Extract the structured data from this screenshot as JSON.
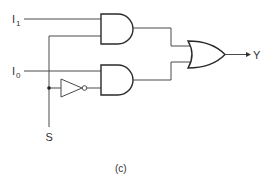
{
  "diagram": {
    "type": "2-to-1 multiplexer logic circuit",
    "caption": "(c)",
    "inputs": {
      "i1": {
        "main": "I",
        "sub": "1"
      },
      "i0": {
        "main": "I",
        "sub": "0"
      },
      "select": "S"
    },
    "output": "Y",
    "gates": [
      {
        "id": "and-gate-1",
        "type": "AND",
        "inputs": [
          "I1",
          "S"
        ]
      },
      {
        "id": "and-gate-0",
        "type": "AND",
        "inputs": [
          "I0",
          "NOT S"
        ]
      },
      {
        "id": "not-gate",
        "type": "NOT",
        "inputs": [
          "S"
        ]
      },
      {
        "id": "or-gate",
        "type": "OR",
        "inputs": [
          "AND1",
          "AND0"
        ],
        "output": "Y"
      }
    ],
    "colors": {
      "line": "#4a4a4a",
      "gate": "#2a2a2a",
      "text": "#333333",
      "background": "#ffffff"
    }
  }
}
